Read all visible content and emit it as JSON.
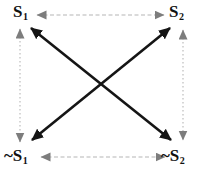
{
  "figure": {
    "background": "#ffffff",
    "colors": {
      "label": "#111111",
      "edge_line": "#b6b6b6",
      "edge_arrowhead": "#7d7d7d",
      "diagonal": "#151515"
    },
    "nodes": {
      "top_left": {
        "prefix": "",
        "base": "S",
        "sub": "1"
      },
      "top_right": {
        "prefix": "",
        "base": "S",
        "sub": "2"
      },
      "bottom_left": {
        "prefix": "~",
        "base": "S",
        "sub": "1"
      },
      "bottom_right": {
        "prefix": "~",
        "base": "S",
        "sub": "2"
      }
    },
    "edges": [
      {
        "from": "S1",
        "to": "S2",
        "type": "double-headed-arrow",
        "style": "gray-dashed-thin",
        "position": "top"
      },
      {
        "from": "~S1",
        "to": "~S2",
        "type": "double-headed-arrow",
        "style": "gray-dashed-thin",
        "position": "bottom"
      },
      {
        "from": "S1",
        "to": "~S1",
        "type": "double-headed-arrow",
        "style": "gray-dotted-thin",
        "position": "left"
      },
      {
        "from": "S2",
        "to": "~S2",
        "type": "double-headed-arrow",
        "style": "gray-dotted-thin",
        "position": "right"
      },
      {
        "from": "S1",
        "to": "~S2",
        "type": "double-headed-arrow",
        "style": "black-solid-thick",
        "position": "diagonal-descending"
      },
      {
        "from": "S2",
        "to": "~S1",
        "type": "double-headed-arrow",
        "style": "black-solid-thick",
        "position": "diagonal-ascending"
      }
    ]
  }
}
